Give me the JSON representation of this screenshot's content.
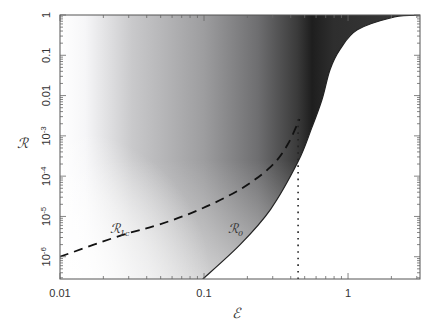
{
  "chart_data": {
    "type": "line",
    "title": "",
    "xlabel": "ℰ",
    "ylabel": "ℛ",
    "xscale": "log",
    "yscale": "log",
    "xlim": [
      0.01,
      3.16
    ],
    "ylim": [
      2.8e-07,
      1
    ],
    "grid": false,
    "x_ticks": [
      {
        "value": 0.01,
        "label": "0.01"
      },
      {
        "value": 0.1,
        "label": "0.1"
      },
      {
        "value": 1,
        "label": "1"
      }
    ],
    "y_ticks": [
      {
        "value": 1,
        "label": "1",
        "exp": ""
      },
      {
        "value": 0.1,
        "label": "0.1",
        "exp": ""
      },
      {
        "value": 0.01,
        "label": "0.01",
        "exp": ""
      },
      {
        "value": 0.001,
        "label": "10",
        "exp": "-3"
      },
      {
        "value": 0.0001,
        "label": "10",
        "exp": "-4"
      },
      {
        "value": 1e-05,
        "label": "10",
        "exp": "-5"
      },
      {
        "value": 1e-06,
        "label": "10",
        "exp": "-6"
      }
    ],
    "series": [
      {
        "name": "ℛ1c",
        "label_main": "ℛ",
        "label_sub": "1c",
        "style": "dashed",
        "color": "#111111",
        "x": [
          0.01,
          0.026,
          0.049,
          0.094,
          0.178,
          0.29,
          0.38,
          0.46
        ],
        "y": [
          1e-06,
          3.3e-06,
          6.3e-06,
          1.5e-05,
          4.7e-05,
          0.00017,
          0.0006,
          0.0026
        ]
      },
      {
        "name": "ℛ0",
        "label_main": "ℛ",
        "label_sub": "0",
        "style": "solid",
        "color": "#222222",
        "x": [
          0.098,
          0.178,
          0.29,
          0.45,
          0.56,
          0.66,
          0.75,
          0.88,
          1.16,
          2.1,
          3.16
        ],
        "y": [
          2.8e-07,
          2e-06,
          1.5e-05,
          0.00023,
          0.0016,
          0.008,
          0.044,
          0.14,
          0.43,
          0.89,
          1.0
        ]
      },
      {
        "name": "threshold",
        "style": "dotted",
        "color": "#222222",
        "x": [
          0.45,
          0.45
        ],
        "y": [
          0.0026,
          2.8e-07
        ]
      }
    ],
    "annotations": [
      {
        "text": "ℛ1c",
        "x": 0.026,
        "y": 5.5e-06
      },
      {
        "text": "ℛ0",
        "x": 0.17,
        "y": 5.5e-06
      }
    ],
    "background": "grayscale density shading; white at low ℰ, darkest near ℰ≈0.5, white region to the right of ℛ0 curve"
  }
}
